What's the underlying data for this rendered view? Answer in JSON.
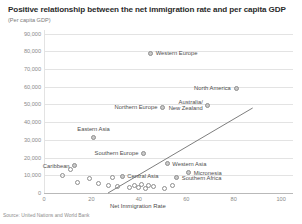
{
  "chart_data": {
    "type": "scatter",
    "title": "Positive relationship between the net immigration rate and per capita GDP",
    "subtitle": "(Per capita GDP)",
    "xlabel": "Net Immigration Rate",
    "ylabel": "",
    "source": "Source: United Nations and World Bank",
    "xlim": [
      0,
      105
    ],
    "ylim": [
      0,
      92000
    ],
    "grid": true,
    "legend": "none",
    "xticks": [
      "0",
      "20",
      "40",
      "60",
      "80",
      "100"
    ],
    "xtick_values": [
      0,
      20,
      40,
      60,
      80,
      100
    ],
    "yticks": [
      "0",
      "10,000",
      "20,000",
      "30,000",
      "40,000",
      "50,000",
      "60,000",
      "70,000",
      "80,000",
      "90,000"
    ],
    "ytick_values": [
      0,
      10000,
      20000,
      30000,
      40000,
      50000,
      60000,
      70000,
      80000,
      90000
    ],
    "trendline": {
      "x0": 27,
      "y0": 0,
      "x1": 88,
      "y1": 48000
    },
    "points": [
      {
        "label": "Western Europe",
        "x": 45,
        "y": 79000,
        "label_pos": "right"
      },
      {
        "label": "North America",
        "x": 81,
        "y": 59000,
        "label_pos": "left"
      },
      {
        "label": "Australia/\nNew Zealand",
        "x": 69,
        "y": 49500,
        "label_pos": "left"
      },
      {
        "label": "Northern Europe",
        "x": 50,
        "y": 48500,
        "label_pos": "left"
      },
      {
        "label": "Eastern Asia",
        "x": 21,
        "y": 31500,
        "label_pos": "top"
      },
      {
        "label": "Southern Europe",
        "x": 42,
        "y": 22500,
        "label_pos": "left"
      },
      {
        "label": "Western Asia",
        "x": 52,
        "y": 16500,
        "label_pos": "right"
      },
      {
        "label": "Micronesia",
        "x": 61,
        "y": 11500,
        "label_pos": "right"
      },
      {
        "label": "Southern Africa",
        "x": 56,
        "y": 8500,
        "label_pos": "right"
      },
      {
        "label": "Caribbean",
        "x": 13,
        "y": 15500,
        "label_pos": "left"
      },
      {
        "label": "Central Asia",
        "x": 33,
        "y": 9500,
        "label_pos": "right"
      },
      {
        "label": "",
        "x": 8,
        "y": 10000,
        "label_pos": "none"
      },
      {
        "label": "",
        "x": 19,
        "y": 8000,
        "label_pos": "none"
      },
      {
        "label": "",
        "x": 23,
        "y": 5500,
        "label_pos": "none"
      },
      {
        "label": "",
        "x": 27,
        "y": 4500,
        "label_pos": "none"
      },
      {
        "label": "",
        "x": 31,
        "y": 3500,
        "label_pos": "none"
      },
      {
        "label": "",
        "x": 36,
        "y": 3000,
        "label_pos": "none"
      },
      {
        "label": "",
        "x": 38,
        "y": 4200,
        "label_pos": "none"
      },
      {
        "label": "",
        "x": 40,
        "y": 3200,
        "label_pos": "none"
      },
      {
        "label": "",
        "x": 41,
        "y": 4800,
        "label_pos": "none"
      },
      {
        "label": "",
        "x": 43,
        "y": 2800,
        "label_pos": "none"
      },
      {
        "label": "",
        "x": 44,
        "y": 4000,
        "label_pos": "none"
      },
      {
        "label": "",
        "x": 46,
        "y": 3400,
        "label_pos": "none"
      },
      {
        "label": "",
        "x": 29,
        "y": 8800,
        "label_pos": "none"
      },
      {
        "label": "",
        "x": 14,
        "y": 6000,
        "label_pos": "none"
      },
      {
        "label": "",
        "x": 11,
        "y": 13000,
        "label_pos": "none"
      },
      {
        "label": "",
        "x": 51,
        "y": 2600,
        "label_pos": "none"
      },
      {
        "label": "",
        "x": 54,
        "y": 4400,
        "label_pos": "none"
      }
    ]
  }
}
